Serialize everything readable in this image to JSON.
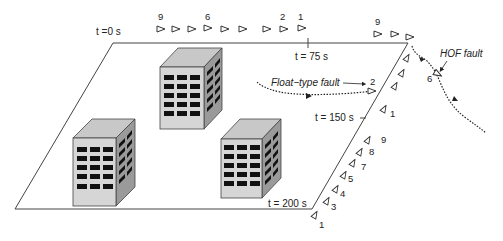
{
  "diagram": {
    "time_labels": [
      {
        "id": "t0",
        "text": "t =0 s"
      },
      {
        "id": "t75",
        "text": "t = 75 s"
      },
      {
        "id": "t150",
        "text": "t = 150 s"
      },
      {
        "id": "t200",
        "text": "t = 200 s"
      }
    ],
    "fault_labels": {
      "float": "Float−type fault",
      "hof": "HOF fault"
    },
    "uav_numbers": {
      "top_row": [
        "9",
        "6",
        "2",
        "1"
      ],
      "corner": "9",
      "float_uav": "2",
      "hof_uav": "6",
      "right_edge": [
        "1",
        "9",
        "8",
        "7",
        "5",
        "4",
        "3",
        "1"
      ]
    },
    "buildings": 3,
    "colors": {
      "line": "#333333",
      "building_front": "#d6d6d6",
      "building_top": "#c8c8c8",
      "building_side": "#9a9a9a",
      "window": "#111111"
    }
  }
}
